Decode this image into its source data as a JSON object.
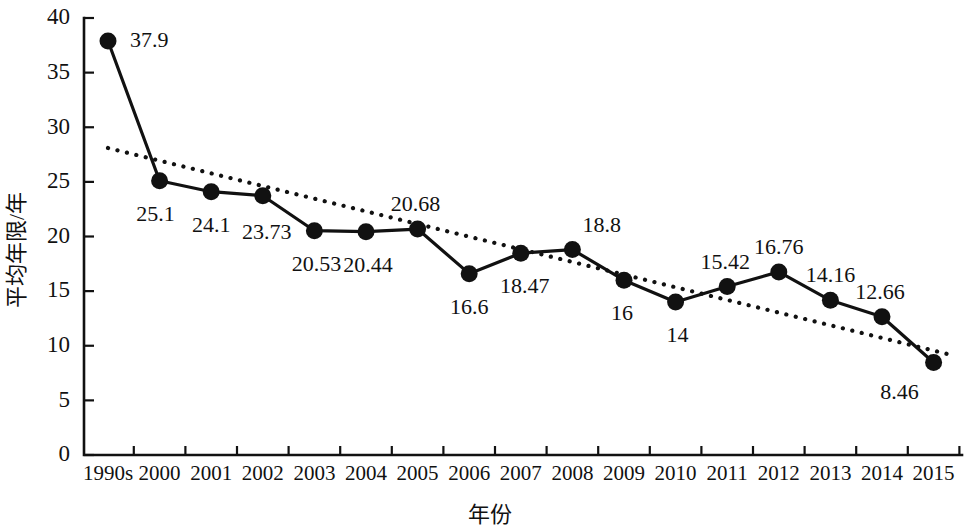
{
  "chart_data": {
    "type": "line",
    "title": "",
    "xlabel": "年份",
    "ylabel": "平均年限/年",
    "categories": [
      "1990s",
      "2000",
      "2001",
      "2002",
      "2003",
      "2004",
      "2005",
      "2006",
      "2007",
      "2008",
      "2009",
      "2010",
      "2011",
      "2012",
      "2013",
      "2014",
      "2015"
    ],
    "values": [
      37.9,
      25.1,
      24.1,
      23.73,
      20.53,
      20.44,
      20.68,
      16.6,
      18.47,
      18.8,
      16,
      14,
      15.42,
      16.76,
      14.16,
      12.66,
      8.46
    ],
    "point_labels": [
      "37.9",
      "25.1",
      "24.1",
      "23.73",
      "20.53",
      "20.44",
      "20.68",
      "16.6",
      "18.47",
      "18.8",
      "16",
      "14",
      "15.42",
      "16.76",
      "14.16",
      "12.66",
      "8.46"
    ],
    "ylim": [
      0,
      40
    ],
    "yticks": [
      0,
      5,
      10,
      15,
      20,
      25,
      30,
      35,
      40
    ],
    "ytick_labels": [
      "0",
      "5",
      "10",
      "15",
      "20",
      "25",
      "30",
      "35",
      "40"
    ],
    "grid": false,
    "legend": "none",
    "series": [
      {
        "name": "平均年限",
        "style": "solid-line-with-round-markers",
        "color": "#111111",
        "values": [
          37.9,
          25.1,
          24.1,
          23.73,
          20.53,
          20.44,
          20.68,
          16.6,
          18.47,
          18.8,
          16,
          14,
          15.42,
          16.76,
          14.16,
          12.66,
          8.46
        ]
      },
      {
        "name": "趋势线",
        "style": "dotted-trendline",
        "color": "#111111",
        "endpoints": [
          {
            "x_category": "1990s",
            "y": 28.1
          },
          {
            "x_category": "2015",
            "y": 9.2
          }
        ]
      }
    ]
  },
  "colors": {
    "foreground": "#111111",
    "background": "#ffffff"
  }
}
